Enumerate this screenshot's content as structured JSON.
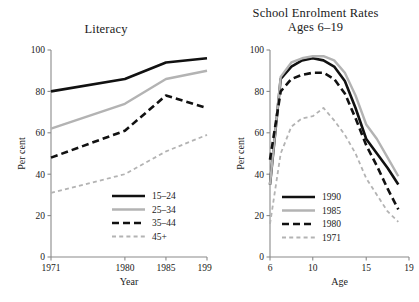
{
  "figure": {
    "background_color": "#ffffff",
    "text_color": "#1a1a1a",
    "axis_color": "#8a8a8a"
  },
  "colors": {
    "black": "#111111",
    "gray": "#b3b3b3"
  },
  "chart_data": [
    {
      "type": "line",
      "title": "Literacy",
      "xlabel": "Year",
      "ylabel": "Per cent",
      "x": [
        1971,
        1980,
        1985,
        1990
      ],
      "xticks": [
        1971,
        1980,
        1985,
        1990
      ],
      "xticklabels": [
        "1971",
        "1980",
        "1985",
        "1990"
      ],
      "yticks": [
        0,
        20,
        40,
        60,
        80,
        100
      ],
      "yticklabels": [
        "0",
        "20",
        "40",
        "60",
        "80",
        "100"
      ],
      "xlim": [
        1971,
        1990
      ],
      "ylim": [
        0,
        100
      ],
      "grid": false,
      "legend_position": "lower right",
      "series": [
        {
          "name": "15–24",
          "values": [
            80,
            86,
            94,
            96
          ],
          "color": "#111111",
          "style": "solid",
          "width": 2.6
        },
        {
          "name": "25–34",
          "values": [
            62,
            74,
            86,
            90
          ],
          "color": "#b3b3b3",
          "style": "solid",
          "width": 2.4
        },
        {
          "name": "35–44",
          "values": [
            48,
            61,
            78,
            72
          ],
          "color": "#111111",
          "style": "dashed",
          "width": 2.6
        },
        {
          "name": "45+",
          "values": [
            31,
            40,
            51,
            59
          ],
          "color": "#b3b3b3",
          "style": "dashed",
          "width": 1.8
        }
      ]
    },
    {
      "type": "line",
      "title": "School Enrolment Rates\nAges 6–19",
      "title_line1": "School Enrolment Rates",
      "title_line2": "Ages 6–19",
      "xlabel": "Age",
      "ylabel": "Per cent",
      "x": [
        6,
        7,
        8,
        9,
        10,
        11,
        12,
        13,
        14,
        15,
        16,
        17,
        18
      ],
      "xticks": [
        6,
        10,
        15,
        19
      ],
      "xticklabels": [
        "6",
        "10",
        "15",
        "19"
      ],
      "yticks": [
        0,
        20,
        40,
        60,
        80,
        100
      ],
      "yticklabels": [
        "0",
        "20",
        "40",
        "60",
        "80",
        "100"
      ],
      "xlim": [
        6,
        19
      ],
      "ylim": [
        0,
        100
      ],
      "grid": false,
      "legend_position": "lower left",
      "series": [
        {
          "name": "1990",
          "values": [
            35,
            86,
            92,
            95,
            96,
            95,
            92,
            85,
            72,
            57,
            50,
            43,
            35
          ],
          "color": "#111111",
          "style": "solid",
          "width": 2.6
        },
        {
          "name": "1985",
          "values": [
            35,
            87,
            94,
            96,
            97,
            97,
            95,
            89,
            78,
            64,
            57,
            48,
            39
          ],
          "color": "#b3b3b3",
          "style": "solid",
          "width": 2.4
        },
        {
          "name": "1980",
          "values": [
            47,
            80,
            86,
            88,
            89,
            89,
            86,
            79,
            67,
            54,
            44,
            33,
            23
          ],
          "color": "#111111",
          "style": "dashed",
          "width": 2.6
        },
        {
          "name": "1971",
          "values": [
            16,
            50,
            63,
            67,
            68,
            72,
            66,
            59,
            50,
            38,
            30,
            22,
            17
          ],
          "color": "#b3b3b3",
          "style": "dashed",
          "width": 1.8
        }
      ]
    }
  ]
}
